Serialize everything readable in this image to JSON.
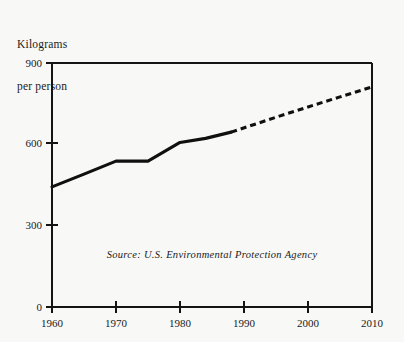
{
  "chart_data": {
    "type": "line",
    "title": "",
    "ylabel": "Kilograms\nper person",
    "ylabel_lines": [
      "Kilograms",
      "per person"
    ],
    "xlabel": "",
    "xlim": [
      1960,
      2010
    ],
    "ylim": [
      0,
      900
    ],
    "grid": false,
    "legend": null,
    "x_ticks": [
      1960,
      1970,
      1980,
      1990,
      2000,
      2010
    ],
    "x_tick_labels": [
      "1960",
      "1970",
      "1980",
      "1990",
      "2000",
      "2010"
    ],
    "y_ticks": [
      0,
      300,
      600,
      900
    ],
    "y_tick_labels": [
      "0",
      "300",
      "600",
      "900"
    ],
    "annotations": [
      {
        "name": "source-note",
        "text": "Source: U.S. Environmental Protection Agency",
        "x": 1985,
        "y": 180,
        "style": "italic"
      }
    ],
    "series": [
      {
        "name": "Municipal solid waste generated (historical)",
        "style": "solid",
        "x": [
          1960,
          1965,
          1970,
          1975,
          1980,
          1984,
          1988
        ],
        "values": [
          443,
          490,
          538,
          538,
          607,
          622,
          645
        ]
      },
      {
        "name": "Municipal solid waste generated (projected)",
        "style": "dashed",
        "x": [
          1988,
          1995,
          2000,
          2005,
          2010
        ],
        "values": [
          645,
          700,
          738,
          775,
          812
        ]
      }
    ]
  },
  "colors": {
    "background": "#f8f8f6",
    "ink": "#101010",
    "axis": "#141414"
  }
}
